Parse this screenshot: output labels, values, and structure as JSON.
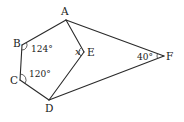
{
  "figure": {
    "type": "geometry",
    "points": {
      "A": {
        "label": "A",
        "x": 66,
        "y": 20
      },
      "B": {
        "label": "B",
        "x": 22,
        "y": 45
      },
      "C": {
        "label": "C",
        "x": 20,
        "y": 80
      },
      "D": {
        "label": "D",
        "x": 49,
        "y": 100
      },
      "E": {
        "label": "E",
        "x": 84,
        "y": 52
      },
      "F": {
        "label": "F",
        "x": 164,
        "y": 56
      }
    },
    "segments": [
      [
        "A",
        "B"
      ],
      [
        "B",
        "C"
      ],
      [
        "C",
        "D"
      ],
      [
        "A",
        "E"
      ],
      [
        "E",
        "D"
      ],
      [
        "A",
        "F"
      ],
      [
        "D",
        "F"
      ]
    ],
    "angles": {
      "B": {
        "text": "124°",
        "value": 124
      },
      "C": {
        "text": "120°",
        "value": 120
      },
      "E": {
        "text": "x",
        "value": null
      },
      "F": {
        "text": "40°",
        "value": 40
      }
    }
  }
}
